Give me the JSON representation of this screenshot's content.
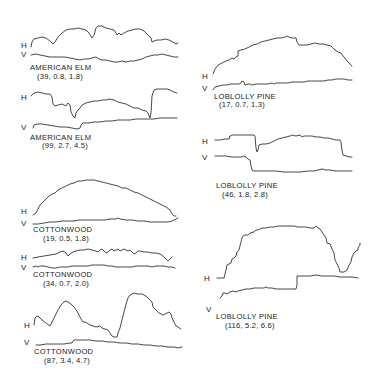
{
  "figure": {
    "axis_labels": {
      "horizontal": "H",
      "vertical": "V"
    },
    "panels": [
      {
        "id": "elm-1",
        "species": "AMERICAN ELM",
        "values": "(39, 0.8, 1.8)"
      },
      {
        "id": "elm-2",
        "species": "AMERICAN ELM",
        "values": "(99, 2.7, 4.5)"
      },
      {
        "id": "cottonwood-1",
        "species": "COTTONWOOD",
        "values": "(19, 0.5, 1.8)"
      },
      {
        "id": "cottonwood-2",
        "species": "COTTONWOOD",
        "values": "(34, 0.7, 2.0)"
      },
      {
        "id": "cottonwood-3",
        "species": "COTTONWOOD",
        "values": "(87, 3.4, 4.7)"
      },
      {
        "id": "pine-1",
        "species": "LOBLOLLY  PINE",
        "values": "(17, 0.7, 1.3)"
      },
      {
        "id": "pine-2",
        "species": "LOBLOLLY  PINE",
        "values": "(46, 1.8, 2.8)"
      },
      {
        "id": "pine-3",
        "species": "LOBLOLLY  PINE",
        "values": "(116, 5.2, 6.6)"
      }
    ]
  }
}
